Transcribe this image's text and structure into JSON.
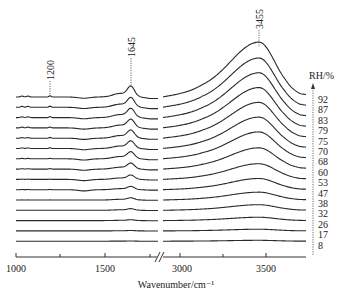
{
  "chart_data": {
    "type": "line",
    "title": "",
    "xlabel": "Wavenumber/cm⁻¹",
    "ylabel": "",
    "x_axis": {
      "broken": true,
      "segments": [
        {
          "range": [
            1000,
            1800
          ],
          "ticks": [
            1000,
            1250,
            1500,
            1750
          ],
          "tick_labels": [
            "1000",
            "1500"
          ]
        },
        {
          "range": [
            2900,
            3700
          ],
          "ticks": [
            3000,
            3250,
            3500
          ],
          "tick_labels": [
            "3000",
            "3500"
          ]
        }
      ],
      "tick_labels": [
        "1000",
        "1500",
        "3000",
        "3500"
      ]
    },
    "grid": false,
    "legend": {
      "title": "RH/%",
      "position": "right",
      "arrow": "upward dashed",
      "entries": [
        "92",
        "87",
        "83",
        "79",
        "75",
        "70",
        "68",
        "60",
        "53",
        "47",
        "38",
        "32",
        "26",
        "17",
        "8"
      ]
    },
    "annotations": [
      {
        "label": "1200",
        "x": 1200
      },
      {
        "label": "1645",
        "x": 1645
      },
      {
        "label": "3455",
        "x": 3455
      }
    ],
    "series": [
      {
        "name": "92",
        "peak_1645_height": 10,
        "peak_3455_height": 49
      },
      {
        "name": "87",
        "peak_1645_height": 9,
        "peak_3455_height": 44
      },
      {
        "name": "83",
        "peak_1645_height": 8.5,
        "peak_3455_height": 40
      },
      {
        "name": "79",
        "peak_1645_height": 8,
        "peak_3455_height": 36
      },
      {
        "name": "75",
        "peak_1645_height": 7.5,
        "peak_3455_height": 32
      },
      {
        "name": "70",
        "peak_1645_height": 7,
        "peak_3455_height": 28
      },
      {
        "name": "68",
        "peak_1645_height": 6.5,
        "peak_3455_height": 24
      },
      {
        "name": "60",
        "peak_1645_height": 5.5,
        "peak_3455_height": 19
      },
      {
        "name": "53",
        "peak_1645_height": 4,
        "peak_3455_height": 14
      },
      {
        "name": "47",
        "peak_1645_height": 3,
        "peak_3455_height": 10
      },
      {
        "name": "38",
        "peak_1645_height": 2,
        "peak_3455_height": 7
      },
      {
        "name": "32",
        "peak_1645_height": 1.5,
        "peak_3455_height": 5
      },
      {
        "name": "26",
        "peak_1645_height": 0.8,
        "peak_3455_height": 3
      },
      {
        "name": "17",
        "peak_1645_height": 0.4,
        "peak_3455_height": 1.5
      },
      {
        "name": "8",
        "peak_1645_height": 0.2,
        "peak_3455_height": 0.8
      }
    ]
  }
}
